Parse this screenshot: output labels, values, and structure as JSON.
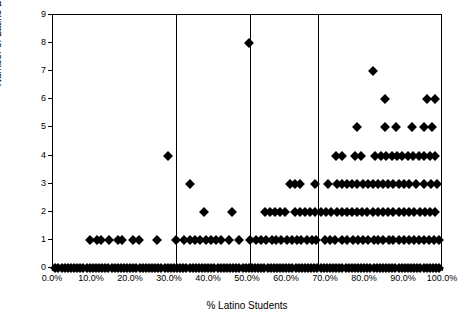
{
  "chart_data": {
    "type": "scatter",
    "title": "",
    "xlabel": "% Latino Students",
    "ylabel": "Number of Latino Board members",
    "xlim": [
      0,
      100
    ],
    "ylim": [
      0,
      9
    ],
    "grid": false,
    "legend": null,
    "xtick_labels": [
      "0.0%",
      "10.0%",
      "20.0%",
      "30.0%",
      "40.0%",
      "50.0%",
      "60.0%",
      "70.0%",
      "80.0%",
      "90.0%",
      "100.0%"
    ],
    "xtick_values": [
      0,
      10,
      20,
      30,
      40,
      50,
      60,
      70,
      80,
      90,
      100
    ],
    "ytick_labels": [
      "0",
      "1",
      "2",
      "3",
      "4",
      "5",
      "6",
      "7",
      "8",
      "9"
    ],
    "ytick_values": [
      0,
      1,
      2,
      3,
      4,
      5,
      6,
      7,
      8,
      9
    ],
    "reference_lines": [
      {
        "orientation": "vertical",
        "value": 31.5
      },
      {
        "orientation": "vertical",
        "value": 50.5
      },
      {
        "orientation": "vertical",
        "value": 68.0
      }
    ],
    "marker": {
      "shape": "diamond",
      "color": "#000000",
      "size": 7
    },
    "points": [
      [
        0.6,
        0
      ],
      [
        1.4,
        0
      ],
      [
        2.2,
        0
      ],
      [
        3.0,
        0
      ],
      [
        3.8,
        0
      ],
      [
        4.6,
        0
      ],
      [
        5.4,
        0
      ],
      [
        6.2,
        0
      ],
      [
        7.0,
        0
      ],
      [
        7.8,
        0
      ],
      [
        8.6,
        0
      ],
      [
        9.4,
        0
      ],
      [
        10.2,
        0
      ],
      [
        11.0,
        0
      ],
      [
        11.8,
        0
      ],
      [
        12.6,
        0
      ],
      [
        13.4,
        0
      ],
      [
        14.2,
        0
      ],
      [
        15.0,
        0
      ],
      [
        15.8,
        0
      ],
      [
        16.6,
        0
      ],
      [
        17.4,
        0
      ],
      [
        18.2,
        0
      ],
      [
        19.0,
        0
      ],
      [
        19.8,
        0
      ],
      [
        20.6,
        0
      ],
      [
        21.4,
        0
      ],
      [
        22.2,
        0
      ],
      [
        23.0,
        0
      ],
      [
        23.8,
        0
      ],
      [
        24.6,
        0
      ],
      [
        25.4,
        0
      ],
      [
        26.2,
        0
      ],
      [
        27.0,
        0
      ],
      [
        27.8,
        0
      ],
      [
        28.6,
        0
      ],
      [
        29.4,
        0
      ],
      [
        30.2,
        0
      ],
      [
        31.0,
        0
      ],
      [
        31.8,
        0
      ],
      [
        32.6,
        0
      ],
      [
        33.4,
        0
      ],
      [
        34.2,
        0
      ],
      [
        35.0,
        0
      ],
      [
        35.8,
        0
      ],
      [
        36.6,
        0
      ],
      [
        37.4,
        0
      ],
      [
        38.2,
        0
      ],
      [
        39.0,
        0
      ],
      [
        39.8,
        0
      ],
      [
        40.6,
        0
      ],
      [
        41.4,
        0
      ],
      [
        42.2,
        0
      ],
      [
        43.0,
        0
      ],
      [
        43.8,
        0
      ],
      [
        44.6,
        0
      ],
      [
        45.4,
        0
      ],
      [
        46.2,
        0
      ],
      [
        47.0,
        0
      ],
      [
        47.8,
        0
      ],
      [
        48.6,
        0
      ],
      [
        49.4,
        0
      ],
      [
        50.2,
        0
      ],
      [
        51.0,
        0
      ],
      [
        51.8,
        0
      ],
      [
        52.6,
        0
      ],
      [
        53.4,
        0
      ],
      [
        54.2,
        0
      ],
      [
        55.0,
        0
      ],
      [
        55.8,
        0
      ],
      [
        56.6,
        0
      ],
      [
        57.4,
        0
      ],
      [
        58.2,
        0
      ],
      [
        59.0,
        0
      ],
      [
        59.8,
        0
      ],
      [
        60.6,
        0
      ],
      [
        61.4,
        0
      ],
      [
        62.2,
        0
      ],
      [
        63.0,
        0
      ],
      [
        63.8,
        0
      ],
      [
        64.6,
        0
      ],
      [
        65.4,
        0
      ],
      [
        66.2,
        0
      ],
      [
        67.0,
        0
      ],
      [
        67.8,
        0
      ],
      [
        68.6,
        0
      ],
      [
        69.4,
        0
      ],
      [
        70.2,
        0
      ],
      [
        71.0,
        0
      ],
      [
        71.8,
        0
      ],
      [
        72.6,
        0
      ],
      [
        73.4,
        0
      ],
      [
        74.2,
        0
      ],
      [
        75.0,
        0
      ],
      [
        75.8,
        0
      ],
      [
        76.6,
        0
      ],
      [
        77.4,
        0
      ],
      [
        78.2,
        0
      ],
      [
        79.0,
        0
      ],
      [
        79.8,
        0
      ],
      [
        80.6,
        0
      ],
      [
        81.4,
        0
      ],
      [
        82.2,
        0
      ],
      [
        83.0,
        0
      ],
      [
        83.8,
        0
      ],
      [
        84.6,
        0
      ],
      [
        85.4,
        0
      ],
      [
        86.2,
        0
      ],
      [
        87.0,
        0
      ],
      [
        87.8,
        0
      ],
      [
        88.6,
        0
      ],
      [
        89.4,
        0
      ],
      [
        90.2,
        0
      ],
      [
        91.0,
        0
      ],
      [
        91.8,
        0
      ],
      [
        92.6,
        0
      ],
      [
        93.4,
        0
      ],
      [
        94.2,
        0
      ],
      [
        95.0,
        0
      ],
      [
        95.8,
        0
      ],
      [
        96.6,
        0
      ],
      [
        97.4,
        0
      ],
      [
        98.2,
        0
      ],
      [
        99.0,
        0
      ],
      [
        9.5,
        1
      ],
      [
        11.3,
        1
      ],
      [
        12.4,
        1
      ],
      [
        14.3,
        1
      ],
      [
        16.6,
        1
      ],
      [
        17.6,
        1
      ],
      [
        20.6,
        1
      ],
      [
        22.0,
        1
      ],
      [
        26.6,
        1
      ],
      [
        31.6,
        1
      ],
      [
        33.5,
        1
      ],
      [
        35.0,
        1
      ],
      [
        36.3,
        1
      ],
      [
        37.7,
        1
      ],
      [
        39.2,
        1
      ],
      [
        40.4,
        1
      ],
      [
        41.8,
        1
      ],
      [
        43.0,
        1
      ],
      [
        45.2,
        1
      ],
      [
        47.8,
        1
      ],
      [
        50.6,
        1
      ],
      [
        52.0,
        1
      ],
      [
        53.3,
        1
      ],
      [
        54.5,
        1
      ],
      [
        56.1,
        1
      ],
      [
        57.3,
        1
      ],
      [
        58.5,
        1
      ],
      [
        59.9,
        1
      ],
      [
        61.2,
        1
      ],
      [
        62.5,
        1
      ],
      [
        63.7,
        1
      ],
      [
        65.1,
        1
      ],
      [
        66.3,
        1
      ],
      [
        67.5,
        1
      ],
      [
        69.7,
        1
      ],
      [
        71.1,
        1
      ],
      [
        72.3,
        1
      ],
      [
        74.2,
        1
      ],
      [
        75.5,
        1
      ],
      [
        77.0,
        1
      ],
      [
        78.2,
        1
      ],
      [
        79.6,
        1
      ],
      [
        80.8,
        1
      ],
      [
        82.2,
        1
      ],
      [
        83.4,
        1
      ],
      [
        84.7,
        1
      ],
      [
        86.1,
        1
      ],
      [
        87.3,
        1
      ],
      [
        88.6,
        1
      ],
      [
        90.0,
        1
      ],
      [
        91.2,
        1
      ],
      [
        92.6,
        1
      ],
      [
        93.8,
        1
      ],
      [
        95.2,
        1
      ],
      [
        96.4,
        1
      ],
      [
        97.6,
        1
      ],
      [
        99.0,
        1
      ],
      [
        38.6,
        2
      ],
      [
        46.0,
        2
      ],
      [
        54.3,
        2
      ],
      [
        55.7,
        2
      ],
      [
        57.0,
        2
      ],
      [
        58.3,
        2
      ],
      [
        59.6,
        2
      ],
      [
        62.0,
        2
      ],
      [
        63.3,
        2
      ],
      [
        64.6,
        2
      ],
      [
        66.0,
        2
      ],
      [
        67.3,
        2
      ],
      [
        68.8,
        2
      ],
      [
        70.1,
        2
      ],
      [
        71.4,
        2
      ],
      [
        72.7,
        2
      ],
      [
        74.0,
        2
      ],
      [
        75.3,
        2
      ],
      [
        76.6,
        2
      ],
      [
        78.0,
        2
      ],
      [
        79.3,
        2
      ],
      [
        80.6,
        2
      ],
      [
        82.0,
        2
      ],
      [
        83.3,
        2
      ],
      [
        84.6,
        2
      ],
      [
        86.0,
        2
      ],
      [
        87.3,
        2
      ],
      [
        88.6,
        2
      ],
      [
        90.0,
        2
      ],
      [
        91.3,
        2
      ],
      [
        92.6,
        2
      ],
      [
        94.0,
        2
      ],
      [
        95.3,
        2
      ],
      [
        96.6,
        2
      ],
      [
        98.0,
        2
      ],
      [
        35.0,
        3
      ],
      [
        60.8,
        3
      ],
      [
        62.1,
        3
      ],
      [
        63.4,
        3
      ],
      [
        67.2,
        3
      ],
      [
        70.4,
        3
      ],
      [
        72.8,
        3
      ],
      [
        74.1,
        3
      ],
      [
        75.4,
        3
      ],
      [
        76.7,
        3
      ],
      [
        78.0,
        3
      ],
      [
        79.4,
        3
      ],
      [
        80.7,
        3
      ],
      [
        82.0,
        3
      ],
      [
        83.3,
        3
      ],
      [
        84.6,
        3
      ],
      [
        86.0,
        3
      ],
      [
        87.3,
        3
      ],
      [
        88.6,
        3
      ],
      [
        90.0,
        3
      ],
      [
        91.3,
        3
      ],
      [
        93.0,
        3
      ],
      [
        95.0,
        3
      ],
      [
        97.0,
        3
      ],
      [
        98.4,
        3
      ],
      [
        29.5,
        4
      ],
      [
        72.6,
        4
      ],
      [
        74.0,
        4
      ],
      [
        77.5,
        4
      ],
      [
        79.0,
        4
      ],
      [
        82.5,
        4
      ],
      [
        84.0,
        4
      ],
      [
        85.4,
        4
      ],
      [
        86.8,
        4
      ],
      [
        88.2,
        4
      ],
      [
        89.6,
        4
      ],
      [
        91.0,
        4
      ],
      [
        92.4,
        4
      ],
      [
        93.8,
        4
      ],
      [
        95.2,
        4
      ],
      [
        96.6,
        4
      ],
      [
        98.0,
        4
      ],
      [
        78.0,
        5
      ],
      [
        85.0,
        5
      ],
      [
        88.0,
        5
      ],
      [
        92.0,
        5
      ],
      [
        95.0,
        5
      ],
      [
        97.2,
        5
      ],
      [
        85.0,
        6
      ],
      [
        96.0,
        6
      ],
      [
        98.0,
        6
      ],
      [
        82.0,
        7
      ],
      [
        50.3,
        8
      ]
    ]
  }
}
